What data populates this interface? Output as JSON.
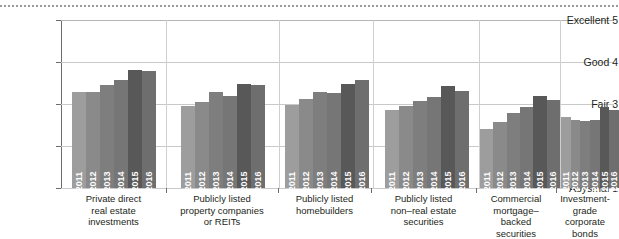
{
  "chart_data": {
    "type": "bar",
    "title": "",
    "subtitle": "",
    "xlabel": "",
    "ylabel": "",
    "ylim": [
      1,
      5
    ],
    "grid": true,
    "legend_position": "none",
    "categories": [
      "Private direct\nreal estate\ninvestments",
      "Publicly listed\nproperty companies\nor REITs",
      "Publicly listed\nhomebuilders",
      "Publicly listed\nnon–real estate\nsecurities",
      "Commercial\nmortgage–backed\nsecurities",
      "Investment-grade\ncorporate bonds"
    ],
    "x": [
      "2011",
      "2012",
      "2013",
      "2014",
      "2015",
      "2016"
    ],
    "ytick_labels": [
      "Excellent 5",
      "Good 4",
      "Fair 3",
      "Poor 2",
      "Abysmal 1"
    ],
    "ytick_values": [
      5,
      4,
      3,
      2,
      1
    ],
    "series": [
      {
        "name": "Private direct real estate investments",
        "values": [
          3.28,
          3.28,
          3.45,
          3.58,
          3.82,
          3.78
        ]
      },
      {
        "name": "Publicly listed property companies or REITs",
        "values": [
          2.96,
          3.04,
          3.28,
          3.2,
          3.48,
          3.46
        ]
      },
      {
        "name": "Publicly listed homebuilders",
        "values": [
          2.98,
          3.12,
          3.28,
          3.26,
          3.48,
          3.56
        ]
      },
      {
        "name": "Publicly listed non–real estate securities",
        "values": [
          2.86,
          2.96,
          3.08,
          3.16,
          3.42,
          3.3
        ]
      },
      {
        "name": "Commercial mortgage–backed securities",
        "values": [
          2.4,
          2.58,
          2.78,
          2.92,
          3.2,
          3.1
        ]
      },
      {
        "name": "Investment-grade corporate bonds",
        "values": [
          2.68,
          2.62,
          2.6,
          2.62,
          2.94,
          2.86
        ]
      }
    ],
    "bar_colors": [
      "#9d9d9d",
      "#8a8a8a",
      "#7e7e7e",
      "#767676",
      "#585858",
      "#6e6e6e"
    ]
  }
}
